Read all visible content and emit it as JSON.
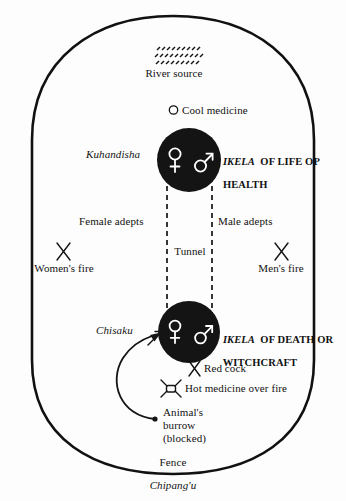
{
  "diagram": {
    "outer_boundary_label": "Fence",
    "outer_boundary_name_label": "Chipang'u",
    "colors": {
      "ink": "#111111",
      "circle_fill": "#141414",
      "symbol_stroke": "#ffffff",
      "background": "#ffffff"
    },
    "labels": {
      "river_source": "River source",
      "cool_medicine": "Cool medicine",
      "kuhandisha": "Kuhandisha",
      "ikela_life_line1_em": "IKELA",
      "ikela_life_line1_rest": "  OF LIFE OP",
      "ikela_life_line2": "HEALTH",
      "female_adepts": "Female adepts",
      "male_adepts": "Male adepts",
      "tunnel": "Tunnel",
      "womens_fire": "Women's fire",
      "mens_fire": "Men's fire",
      "chisaku": "Chisaku",
      "ikela_death_line1_em": "IKELA",
      "ikela_death_line1_rest": "  OF DEATH OR",
      "ikela_death_line2": "WITCHCRAFT",
      "red_cock": "Red cock",
      "hot_medicine": "Hot medicine over fire",
      "animals_burrow_line1": "Animal's",
      "animals_burrow_line2": "burrow",
      "animals_burrow_line3": "(blocked)",
      "fence": "Fence",
      "chipangu": "Chipang'u"
    },
    "icons": {
      "river_source": "wavy-water-lines-icon",
      "cool_medicine": "open-circle-icon",
      "womens_fire": "crossed-sticks-fire-icon",
      "mens_fire": "crossed-sticks-fire-icon",
      "red_cock": "crossed-sticks-icon",
      "hot_medicine": "pot-over-fire-icon",
      "upper_ikela": "filled-circle-ikela-icon",
      "lower_ikela": "filled-circle-ikela-icon",
      "venus": "venus-female-symbol-icon",
      "mars": "mars-male-symbol-icon",
      "burrow": "burrow-dot-icon",
      "burrow_arrow": "curved-arrow-icon",
      "chisaku_arrow": "short-arrow-icon",
      "tunnel_walls": "dashed-tunnel-lines-icon"
    },
    "geometry": {
      "enclosure_note": "rounded oval fence",
      "upper_ikela_center": [
        189,
        160
      ],
      "lower_ikela_center": [
        189,
        332
      ],
      "tunnel_left_x": 167,
      "tunnel_right_x": 212
    }
  }
}
